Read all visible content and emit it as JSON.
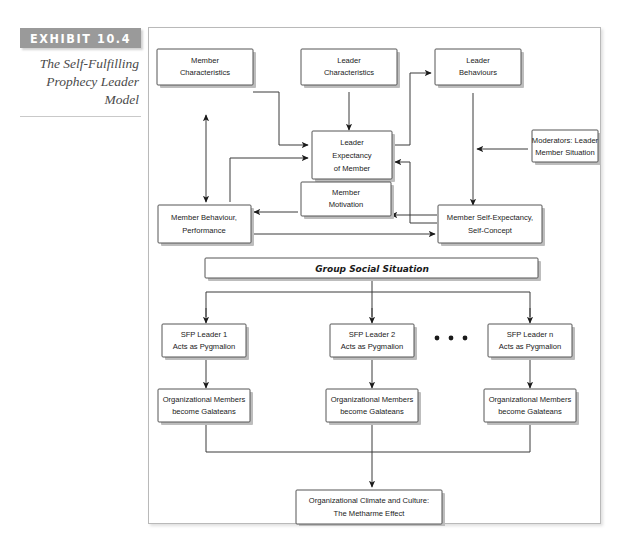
{
  "exhibit": {
    "number_label": "EXHIBIT 10.4",
    "title_lines": [
      "The Self-Fulfilling",
      "Prophecy Leader",
      "Model"
    ],
    "title": "The Self-Fulfilling Prophecy Leader Model"
  },
  "diagram": {
    "type": "flowchart",
    "boxes": {
      "member_characteristics": {
        "lines": [
          "Member",
          "Characteristics"
        ]
      },
      "leader_characteristics": {
        "lines": [
          "Leader",
          "Characteristics"
        ]
      },
      "leader_behaviours": {
        "lines": [
          "Leader",
          "Behaviours"
        ]
      },
      "leader_expectancy": {
        "lines": [
          "Leader",
          "Expectancy",
          "of Member"
        ]
      },
      "moderators": {
        "lines": [
          "Moderators: Leader",
          "Member Situation"
        ]
      },
      "member_behaviour": {
        "lines": [
          "Member Behaviour,",
          "Performance"
        ]
      },
      "member_motivation": {
        "lines": [
          "Member",
          "Motivation"
        ]
      },
      "member_self_expectancy": {
        "lines": [
          "Member Self-Expectancy,",
          "Self-Concept"
        ]
      },
      "group_social_situation": {
        "label": "Group Social Situation"
      },
      "sfp_leader_1": {
        "lines": [
          "SFP Leader 1",
          "Acts as Pygmalion"
        ]
      },
      "sfp_leader_2": {
        "lines": [
          "SFP Leader 2",
          "Acts as Pygmalion"
        ]
      },
      "sfp_leader_n": {
        "lines": [
          "SFP Leader n",
          "Acts as Pygmalion"
        ]
      },
      "org_members_1": {
        "lines": [
          "Organizational Members",
          "become Galateans"
        ]
      },
      "org_members_2": {
        "lines": [
          "Organizational Members",
          "become Galateans"
        ]
      },
      "org_members_n": {
        "lines": [
          "Organizational Members",
          "become Galateans"
        ]
      },
      "org_climate": {
        "lines": [
          "Organizational Climate and Culture:",
          "The Metharme Effect"
        ]
      }
    },
    "ellipsis": "• • •",
    "colors": {
      "exhibit_bar": "#9a9a9a",
      "box_border": "#555555",
      "box_shadow": "#bdbdbd",
      "connector": "#3a3a3a",
      "frame_border": "#b9b9b9",
      "caption_text": "#4a4a4a"
    }
  }
}
